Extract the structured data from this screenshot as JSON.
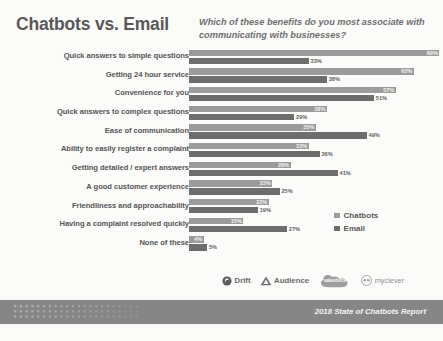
{
  "header": {
    "title": "Chatbots vs. Email",
    "subtitle": "Which of these benefits do you most associate with communicating with businesses?"
  },
  "legend": {
    "items": [
      {
        "label": "Chatbots",
        "color": "#9b9b9b"
      },
      {
        "label": "Email",
        "color": "#6d6d6d"
      }
    ]
  },
  "logos": [
    {
      "name": "Drift",
      "mark": "drift-logo-icon"
    },
    {
      "name": "Audience",
      "mark": "audience-logo-icon"
    },
    {
      "name": "salesforce",
      "mark": "salesforce-cloud-icon"
    },
    {
      "name": "myclever",
      "mark": "myclever-logo-icon"
    }
  ],
  "footer": {
    "text": "2018 State of Chatbots Report",
    "background": "#868686"
  },
  "chart_data": {
    "type": "bar",
    "orientation": "horizontal",
    "title": "Chatbots vs. Email",
    "subtitle": "Which of these benefits do you most associate with communicating with businesses?",
    "xlabel": "",
    "ylabel": "",
    "xlim": [
      0,
      70
    ],
    "grid": false,
    "legend_position": "right",
    "value_suffix": "%",
    "categories": [
      "Quick answers to simple questions",
      "Getting 24 hour service",
      "Convenience for you",
      "Quick answers to complex questions",
      "Ease of communication",
      "Ability to easily register a complaint",
      "Getting detailed / expert answers",
      "A good customer experience",
      "Friendliness and approachability",
      "Having a complaint resolved quickly",
      "None of these"
    ],
    "series": [
      {
        "name": "Chatbots",
        "color": "#9b9b9b",
        "values": [
          69,
          62,
          57,
          38,
          35,
          33,
          28,
          23,
          22,
          15,
          4
        ],
        "labels": [
          "69%",
          "62%",
          "57%",
          "38%",
          "35%",
          "33%",
          "28%",
          "23%",
          "22%",
          "15%",
          "4%"
        ]
      },
      {
        "name": "Email",
        "color": "#6d6d6d",
        "values": [
          33,
          38,
          51,
          29,
          49,
          36,
          41,
          25,
          19,
          27,
          5
        ],
        "labels": [
          "33%",
          "38%",
          "51%",
          "29%",
          "49%",
          "36%",
          "41%",
          "25%",
          "19%",
          "27%",
          "5%"
        ]
      }
    ]
  }
}
